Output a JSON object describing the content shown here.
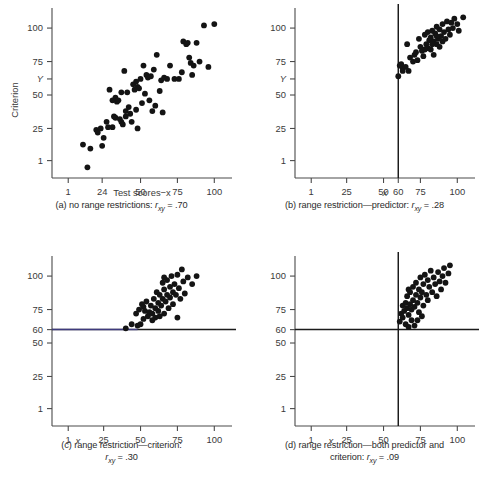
{
  "figure": {
    "background": "#ffffff",
    "dot_color": "#141414",
    "axis_color": "#4a4a4a",
    "restriction_line_color": "#1b1b1b",
    "tint_color": "#4a46a0"
  },
  "chart_data": [
    {
      "id": "a",
      "type": "scatter",
      "title": "",
      "caption_prefix": "(a)",
      "caption_text": "no range restrictions:",
      "caption_stat_symbol": "r",
      "caption_stat_subscript": "xy",
      "caption_stat_value": "= .70",
      "correlation": 0.7,
      "xlabel": "Test scores−x",
      "ylabel": "Criterion",
      "y_axis_variable": "Y",
      "xticks": [
        1,
        24,
        50,
        75,
        100
      ],
      "xticklabels": [
        "1",
        "24",
        "50",
        "75",
        "100"
      ],
      "yticks": [
        1,
        25,
        50,
        62,
        75,
        100
      ],
      "yticklabels": [
        "1",
        "25",
        "50",
        "Y",
        "75",
        "100"
      ],
      "xlim": [
        -10,
        112
      ],
      "ylim": [
        -12,
        115
      ],
      "grid": false,
      "legend": "none",
      "restriction_lines": [],
      "points": [
        [
          11,
          13
        ],
        [
          14,
          -4
        ],
        [
          16,
          10
        ],
        [
          20,
          24
        ],
        [
          21,
          22
        ],
        [
          23,
          25
        ],
        [
          24,
          12
        ],
        [
          25,
          18
        ],
        [
          27,
          30
        ],
        [
          28,
          26
        ],
        [
          29,
          54
        ],
        [
          31,
          46
        ],
        [
          31,
          26
        ],
        [
          32,
          34
        ],
        [
          33,
          48
        ],
        [
          33,
          33
        ],
        [
          34,
          45
        ],
        [
          35,
          46
        ],
        [
          36,
          32
        ],
        [
          37,
          30
        ],
        [
          37,
          52
        ],
        [
          38,
          28
        ],
        [
          39,
          68
        ],
        [
          40,
          38
        ],
        [
          40,
          34
        ],
        [
          41,
          52
        ],
        [
          42,
          41
        ],
        [
          43,
          36
        ],
        [
          44,
          30
        ],
        [
          45,
          58
        ],
        [
          46,
          54
        ],
        [
          47,
          60
        ],
        [
          47,
          39
        ],
        [
          48,
          56
        ],
        [
          48,
          25
        ],
        [
          49,
          55
        ],
        [
          50,
          62
        ],
        [
          51,
          44
        ],
        [
          52,
          72
        ],
        [
          53,
          51
        ],
        [
          54,
          65
        ],
        [
          55,
          63
        ],
        [
          56,
          46
        ],
        [
          57,
          64
        ],
        [
          58,
          38
        ],
        [
          59,
          69
        ],
        [
          60,
          42
        ],
        [
          61,
          80
        ],
        [
          63,
          53
        ],
        [
          64,
          61
        ],
        [
          65,
          37
        ],
        [
          66,
          63
        ],
        [
          68,
          62
        ],
        [
          70,
          72
        ],
        [
          73,
          62
        ],
        [
          76,
          62
        ],
        [
          78,
          67
        ],
        [
          79,
          90
        ],
        [
          81,
          88
        ],
        [
          82,
          89
        ],
        [
          83,
          78
        ],
        [
          84,
          74
        ],
        [
          85,
          65
        ],
        [
          86,
          72
        ],
        [
          88,
          89
        ],
        [
          90,
          75
        ],
        [
          93,
          102
        ],
        [
          96,
          71
        ],
        [
          100,
          103
        ]
      ]
    },
    {
      "id": "b",
      "type": "scatter",
      "title": "",
      "caption_prefix": "(b)",
      "caption_text": "range restriction—predictor:",
      "caption_stat_symbol": "r",
      "caption_stat_subscript": "xy",
      "caption_stat_value": "= .28",
      "correlation": 0.28,
      "xlabel": "x",
      "ylabel": "",
      "y_axis_variable": "Y",
      "xticks": [
        1,
        25,
        50,
        60,
        75,
        100
      ],
      "xticklabels": [
        "1",
        "25",
        "50",
        "60",
        "75",
        "100"
      ],
      "yticks": [
        1,
        25,
        50,
        62,
        75,
        100
      ],
      "yticklabels": [
        "1",
        "25",
        "50",
        "Y",
        "75",
        "100"
      ],
      "xlim": [
        -10,
        112
      ],
      "ylim": [
        -12,
        115
      ],
      "grid": false,
      "legend": "none",
      "restriction_lines": [
        {
          "orientation": "vertical",
          "value": 60,
          "label": "60"
        }
      ],
      "points": [
        [
          60,
          64
        ],
        [
          61,
          72
        ],
        [
          62,
          73
        ],
        [
          63,
          70
        ],
        [
          63,
          68
        ],
        [
          65,
          71
        ],
        [
          66,
          88
        ],
        [
          67,
          68
        ],
        [
          68,
          78
        ],
        [
          70,
          75
        ],
        [
          71,
          80
        ],
        [
          72,
          82
        ],
        [
          73,
          76
        ],
        [
          74,
          92
        ],
        [
          75,
          86
        ],
        [
          76,
          83
        ],
        [
          77,
          79
        ],
        [
          78,
          95
        ],
        [
          79,
          88
        ],
        [
          80,
          85
        ],
        [
          80,
          97
        ],
        [
          81,
          91
        ],
        [
          82,
          84
        ],
        [
          82,
          93
        ],
        [
          83,
          98
        ],
        [
          84,
          90
        ],
        [
          84,
          80
        ],
        [
          85,
          96
        ],
        [
          86,
          88
        ],
        [
          86,
          101
        ],
        [
          87,
          92
        ],
        [
          88,
          86
        ],
        [
          88,
          99
        ],
        [
          89,
          94
        ],
        [
          90,
          103
        ],
        [
          90,
          90
        ],
        [
          91,
          97
        ],
        [
          92,
          92
        ],
        [
          93,
          105
        ],
        [
          94,
          99
        ],
        [
          95,
          95
        ],
        [
          96,
          104
        ],
        [
          97,
          100
        ],
        [
          98,
          107
        ],
        [
          100,
          103
        ],
        [
          101,
          98
        ],
        [
          104,
          108
        ],
        [
          78,
          84
        ],
        [
          83,
          88
        ],
        [
          86,
          94
        ]
      ]
    },
    {
      "id": "c",
      "type": "scatter",
      "title": "",
      "caption_prefix": "(c)",
      "caption_text": "range restriction—criterion:",
      "caption_stat_symbol": "r",
      "caption_stat_subscript": "xy",
      "caption_stat_value": "= .30",
      "correlation": 0.3,
      "xlabel": "x",
      "ylabel": "",
      "y_axis_variable": "",
      "xticks": [
        1,
        25,
        50,
        75,
        100
      ],
      "xticklabels": [
        "1",
        "25",
        "50",
        "75",
        "100"
      ],
      "yticks": [
        1,
        25,
        50,
        60,
        75,
        100
      ],
      "yticklabels": [
        "1",
        "25",
        "50",
        "60",
        "75",
        "100"
      ],
      "xlim": [
        -10,
        112
      ],
      "ylim": [
        -12,
        115
      ],
      "grid": false,
      "legend": "none",
      "restriction_lines": [
        {
          "orientation": "horizontal",
          "value": 60,
          "label": "60"
        }
      ],
      "points": [
        [
          40,
          61
        ],
        [
          44,
          64
        ],
        [
          47,
          72
        ],
        [
          48,
          63
        ],
        [
          49,
          75
        ],
        [
          50,
          64
        ],
        [
          51,
          79
        ],
        [
          52,
          77
        ],
        [
          52,
          68
        ],
        [
          53,
          74
        ],
        [
          54,
          81
        ],
        [
          55,
          70
        ],
        [
          56,
          73
        ],
        [
          57,
          78
        ],
        [
          58,
          72
        ],
        [
          59,
          83
        ],
        [
          60,
          69
        ],
        [
          60,
          76
        ],
        [
          61,
          88
        ],
        [
          62,
          74
        ],
        [
          62,
          80
        ],
        [
          63,
          70
        ],
        [
          63,
          86
        ],
        [
          64,
          78
        ],
        [
          65,
          95
        ],
        [
          65,
          83
        ],
        [
          66,
          72
        ],
        [
          66,
          90
        ],
        [
          67,
          81
        ],
        [
          68,
          97
        ],
        [
          68,
          86
        ],
        [
          69,
          76
        ],
        [
          70,
          92
        ],
        [
          70,
          84
        ],
        [
          71,
          100
        ],
        [
          72,
          88
        ],
        [
          72,
          79
        ],
        [
          73,
          94
        ],
        [
          74,
          86
        ],
        [
          75,
          69
        ],
        [
          75,
          101
        ],
        [
          76,
          91
        ],
        [
          77,
          83
        ],
        [
          78,
          105
        ],
        [
          79,
          96
        ],
        [
          80,
          87
        ],
        [
          82,
          99
        ],
        [
          85,
          94
        ],
        [
          88,
          100
        ],
        [
          66,
          99
        ],
        [
          58,
          67
        ]
      ]
    },
    {
      "id": "d",
      "type": "scatter",
      "title": "",
      "caption_prefix": "(d)",
      "caption_text": "range restriction—both predictor and criterion:",
      "caption_line1": "range restriction—both predictor and",
      "caption_line2": "criterion:",
      "caption_stat_symbol": "r",
      "caption_stat_subscript": "xy",
      "caption_stat_value": "= .09",
      "correlation": 0.09,
      "xlabel": "x",
      "ylabel": "",
      "y_axis_variable": "",
      "xticks": [
        1,
        25,
        50,
        75,
        100
      ],
      "xticklabels": [
        "1",
        "25",
        "50",
        "75",
        "100"
      ],
      "yticks": [
        1,
        25,
        50,
        60,
        75,
        100
      ],
      "yticklabels": [
        "1",
        "25",
        "50",
        "60",
        "75",
        "100"
      ],
      "xlim": [
        -10,
        112
      ],
      "ylim": [
        -12,
        115
      ],
      "grid": false,
      "legend": "none",
      "restriction_lines": [
        {
          "orientation": "vertical",
          "value": 60,
          "label": "60"
        },
        {
          "orientation": "horizontal",
          "value": 60,
          "label": "60"
        }
      ],
      "points": [
        [
          61,
          66
        ],
        [
          62,
          72
        ],
        [
          63,
          78
        ],
        [
          63,
          69
        ],
        [
          64,
          74
        ],
        [
          65,
          80
        ],
        [
          65,
          64
        ],
        [
          66,
          76
        ],
        [
          66,
          85
        ],
        [
          67,
          71
        ],
        [
          67,
          62
        ],
        [
          68,
          79
        ],
        [
          68,
          88
        ],
        [
          69,
          75
        ],
        [
          69,
          67
        ],
        [
          70,
          82
        ],
        [
          70,
          92
        ],
        [
          71,
          77
        ],
        [
          71,
          63
        ],
        [
          72,
          86
        ],
        [
          72,
          95
        ],
        [
          73,
          80
        ],
        [
          74,
          90
        ],
        [
          74,
          73
        ],
        [
          75,
          84
        ],
        [
          75,
          99
        ],
        [
          76,
          88
        ],
        [
          77,
          94
        ],
        [
          77,
          78
        ],
        [
          78,
          101
        ],
        [
          79,
          86
        ],
        [
          80,
          97
        ],
        [
          80,
          82
        ],
        [
          81,
          92
        ],
        [
          82,
          104
        ],
        [
          83,
          88
        ],
        [
          84,
          99
        ],
        [
          85,
          94
        ],
        [
          86,
          85
        ],
        [
          87,
          103
        ],
        [
          88,
          96
        ],
        [
          89,
          90
        ],
        [
          90,
          100
        ],
        [
          91,
          106
        ],
        [
          92,
          95
        ],
        [
          94,
          102
        ],
        [
          95,
          108
        ],
        [
          73,
          67
        ],
        [
          76,
          70
        ],
        [
          67,
          90
        ]
      ]
    }
  ]
}
